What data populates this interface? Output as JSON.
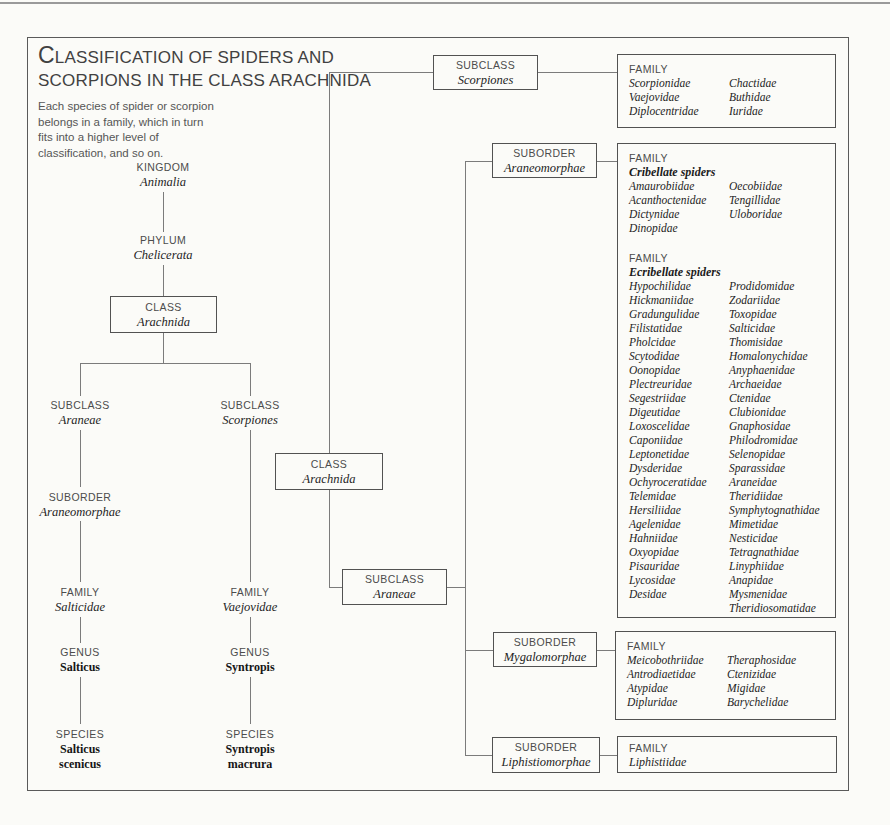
{
  "title": {
    "initial": "C",
    "line1_rest": "LASSIFICATION OF SPIDERS AND",
    "line2": "SCORPIONS IN THE CLASS ARACHNIDA"
  },
  "intro": {
    "lines": [
      "Each species of spider or scorpion",
      "belongs in a family, which in turn",
      "fits into a higher level of",
      "classification, and so on."
    ]
  },
  "colors": {
    "ink": "#3d3d3d",
    "line": "#7b7b7b",
    "background": "#fbfbf8"
  },
  "left_tree": {
    "kingdom": {
      "level": "KINGDOM",
      "name": "Animalia"
    },
    "phylum": {
      "level": "PHYLUM",
      "name": "Chelicerata"
    },
    "class_box": {
      "level": "CLASS",
      "name": "Arachnida"
    },
    "subclass_araneae": {
      "level": "SUBCLASS",
      "name": "Araneae"
    },
    "subclass_scorpiones": {
      "level": "SUBCLASS",
      "name": "Scorpiones"
    },
    "suborder": {
      "level": "SUBORDER",
      "name": "Araneomorphae"
    },
    "family_left": {
      "level": "FAMILY",
      "name": "Salticidae"
    },
    "family_right": {
      "level": "FAMILY",
      "name": "Vaejovidae"
    },
    "genus_left": {
      "level": "GENUS",
      "name": "Salticus"
    },
    "genus_right": {
      "level": "GENUS",
      "name": "Syntropis"
    },
    "species_left": {
      "level": "SPECIES",
      "name_line1": "Salticus",
      "name_line2": "scenicus"
    },
    "species_right": {
      "level": "SPECIES",
      "name_line1": "Syntropis",
      "name_line2": "macrura"
    }
  },
  "right_tree": {
    "class_box": {
      "level": "CLASS",
      "name": "Arachnida"
    },
    "subclass_scorpiones": {
      "level": "SUBCLASS",
      "name": "Scorpiones"
    },
    "subclass_araneae": {
      "level": "SUBCLASS",
      "name": "Araneae"
    },
    "suborder_araneomorphae": {
      "level": "SUBORDER",
      "name": "Araneomorphae"
    },
    "suborder_mygalomorphae": {
      "level": "SUBORDER",
      "name": "Mygalomorphae"
    },
    "suborder_liphistiomorphae": {
      "level": "SUBORDER",
      "name": "Liphistiomorphae"
    }
  },
  "family_boxes": {
    "scorpiones": {
      "heading": "FAMILY",
      "col1": [
        "Scorpionidae",
        "Vaejovidae",
        "Diplocentridae"
      ],
      "col2": [
        "Chactidae",
        "Buthidae",
        "Iuridae"
      ]
    },
    "araneomorphae": {
      "heading1": "FAMILY",
      "subheading1": "Cribellate spiders",
      "cribellate_col1": [
        "Amaurobiidae",
        "Acanthoctenidae",
        "Dictynidae",
        "Dinopidae"
      ],
      "cribellate_col2": [
        "Oecobiidae",
        "Tengillidae",
        "Uloboridae"
      ],
      "heading2": "FAMILY",
      "subheading2": "Ecribellate spiders",
      "ecribellate_col1": [
        "Hypochilidae",
        "Hickmaniidae",
        "Gradungulidae",
        "Filistatidae",
        "Pholcidae",
        "Scytodidae",
        "Oonopidae",
        "Plectreuridae",
        "Segestriidae",
        "Digeutidae",
        "Loxoscelidae",
        "Caponiidae",
        "Leptonetidae",
        "Dysderidae",
        "Ochyroceratidae",
        "Telemidae",
        "Hersiliidae",
        "Agelenidae",
        "Hahniidae",
        "Oxyopidae",
        "Pisauridae",
        "Lycosidae",
        "Desidae"
      ],
      "ecribellate_col2": [
        "Prodidomidae",
        "Zodariidae",
        "Toxopidae",
        "Salticidae",
        "Thomisidae",
        "Homalonychidae",
        "Anyphaenidae",
        "Archaeidae",
        "Ctenidae",
        "Clubionidae",
        "Gnaphosidae",
        "Philodromidae",
        "Selenopidae",
        "Sparassidae",
        "Araneidae",
        "Theridiidae",
        "Symphytognathidae",
        "Mimetidae",
        "Nesticidae",
        "Tetragnathidae",
        "Linyphiidae",
        "Anapidae",
        "Mysmenidae",
        "Theridiosomatidae"
      ]
    },
    "mygalomorphae": {
      "heading": "FAMILY",
      "col1": [
        "Meicobothriidae",
        "Antrodiaetidae",
        "Atypidae",
        "Dipluridae"
      ],
      "col2": [
        "Theraphosidae",
        "Ctenizidae",
        "Migidae",
        "Barychelidae"
      ]
    },
    "liphistiomorphae": {
      "heading": "FAMILY",
      "name": "Liphistiidae"
    }
  }
}
